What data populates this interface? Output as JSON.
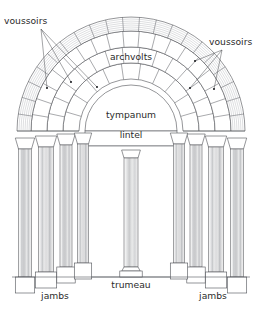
{
  "diagram": {
    "background_color": "#ffffff",
    "line_color": "#53555a",
    "label_color": "#2b2b2b",
    "shade_light": "#f2f2f2",
    "shade_mid": "#d8d9da",
    "shade_dark": "#b9babc"
  },
  "labels": {
    "voussoirs_left": "voussoirs",
    "voussoirs_right": "voussoirs",
    "archvolts": "archvolts",
    "tympanum": "tympanum",
    "lintel": "lintel",
    "trumeau": "trumeau",
    "jambs_left": "jambs",
    "jambs_right": "jambs"
  },
  "label_positions": {
    "voussoirs_left": {
      "x": 4,
      "y": 24
    },
    "voussoirs_right": {
      "x": 209,
      "y": 45
    },
    "archvolts": {
      "x": 131,
      "y": 60
    },
    "tympanum": {
      "x": 131,
      "y": 118
    },
    "lintel": {
      "x": 131,
      "y": 138
    },
    "trumeau": {
      "x": 131,
      "y": 288
    },
    "jambs_left": {
      "x": 55,
      "y": 299
    },
    "jambs_right": {
      "x": 213,
      "y": 299
    }
  },
  "geometry": {
    "center_x": 131,
    "springing_y": 131,
    "arch_radii": [
      52,
      68,
      84,
      100,
      114
    ],
    "ring_segments": [
      11,
      15,
      19,
      21
    ],
    "hatch_ring_index": 3,
    "tympanum_radius": 46,
    "lintel_top_y": 131,
    "lintel_bottom_y": 146,
    "opening_half_width": 46,
    "floor_y": 277,
    "trumeau_half_width": 7,
    "trumeau_top_y": 150,
    "column_count_per_side": 4
  },
  "columns_left": [
    {
      "cx": 25,
      "half": 6.5,
      "base_y": 293,
      "cap_y": 138,
      "shade": "#eceded"
    },
    {
      "cx": 46,
      "half": 7.5,
      "base_y": 288,
      "cap_y": 136,
      "shade": "#dcdddd"
    },
    {
      "cx": 66,
      "half": 6.0,
      "base_y": 283,
      "cap_y": 134,
      "shade": "#ececec"
    },
    {
      "cx": 83,
      "half": 5.5,
      "base_y": 279,
      "cap_y": 133,
      "shade": "#dedfdf"
    }
  ],
  "columns_right": [
    {
      "cx": 237,
      "half": 6.5,
      "base_y": 293,
      "cap_y": 138,
      "shade": "#eceded"
    },
    {
      "cx": 216,
      "half": 7.5,
      "base_y": 288,
      "cap_y": 136,
      "shade": "#dcdddd"
    },
    {
      "cx": 196,
      "half": 6.0,
      "base_y": 283,
      "cap_y": 134,
      "shade": "#ececec"
    },
    {
      "cx": 179,
      "half": 5.5,
      "base_y": 279,
      "cap_y": 133,
      "shade": "#dedfdf"
    }
  ],
  "leaders_left": [
    {
      "x1": 41,
      "y1": 29,
      "x2": 47,
      "y2": 88
    },
    {
      "x1": 41,
      "y1": 29,
      "x2": 71,
      "y2": 82
    },
    {
      "x1": 41,
      "y1": 29,
      "x2": 97,
      "y2": 87
    }
  ],
  "leaders_right": [
    {
      "x1": 222,
      "y1": 50,
      "x2": 195,
      "y2": 61
    },
    {
      "x1": 222,
      "y1": 50,
      "x2": 190,
      "y2": 88
    },
    {
      "x1": 222,
      "y1": 50,
      "x2": 214,
      "y2": 89
    }
  ],
  "leader_dots_left": [
    {
      "cx": 47,
      "cy": 88
    },
    {
      "cx": 71,
      "cy": 82
    },
    {
      "cx": 97,
      "cy": 87
    }
  ],
  "leader_dots_right": [
    {
      "cx": 195,
      "cy": 61
    },
    {
      "cx": 190,
      "cy": 88
    },
    {
      "cx": 214,
      "cy": 89
    }
  ]
}
